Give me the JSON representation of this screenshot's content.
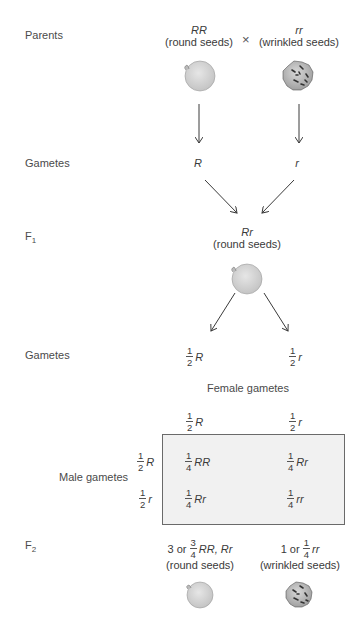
{
  "rows": {
    "parents": "Parents",
    "gametes1": "Gametes",
    "f1": "F",
    "f1_sub": "1",
    "gametes2": "Gametes",
    "f2": "F",
    "f2_sub": "2"
  },
  "parents": {
    "left": {
      "genotype": "RR",
      "phenotype": "(round seeds)",
      "seed": "round-seed"
    },
    "cross": "×",
    "right": {
      "genotype": "rr",
      "phenotype": "(wrinkled seeds)",
      "seed": "wrinkled-seed"
    }
  },
  "gametes1": {
    "left": "R",
    "right": "r"
  },
  "f1": {
    "genotype": "Rr",
    "phenotype": "(round seeds)",
    "seed": "round-seed"
  },
  "gametes2": {
    "left": {
      "num": "1",
      "den": "2",
      "allele": "R"
    },
    "right": {
      "num": "1",
      "den": "2",
      "allele": "r"
    }
  },
  "punnett": {
    "female_label": "Female gametes",
    "male_label": "Male gametes",
    "columns": [
      {
        "num": "1",
        "den": "2",
        "allele": "R"
      },
      {
        "num": "1",
        "den": "2",
        "allele": "r"
      }
    ],
    "rows": [
      {
        "num": "1",
        "den": "2",
        "allele": "R"
      },
      {
        "num": "1",
        "den": "2",
        "allele": "r"
      }
    ],
    "cells": [
      [
        {
          "num": "1",
          "den": "4",
          "genotype": "RR"
        },
        {
          "num": "1",
          "den": "4",
          "genotype": "Rr"
        }
      ],
      [
        {
          "num": "1",
          "den": "4",
          "genotype": "Rr"
        },
        {
          "num": "1",
          "den": "4",
          "genotype": "rr"
        }
      ]
    ],
    "fill": "#f1f1f1",
    "border": "#6a6a6a"
  },
  "f2": {
    "left": {
      "prefix": "3 or",
      "num": "3",
      "den": "4",
      "genotype": "RR, Rr",
      "phenotype": "(round seeds)",
      "seed": "round-seed"
    },
    "right": {
      "prefix": "1 or",
      "num": "1",
      "den": "4",
      "genotype": "rr",
      "phenotype": "(wrinkled seeds)",
      "seed": "wrinkled-seed"
    }
  }
}
